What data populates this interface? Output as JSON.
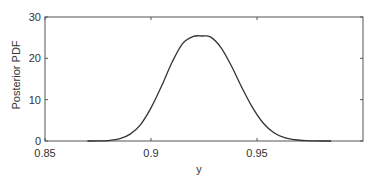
{
  "chart_data": {
    "type": "line",
    "title": "",
    "xlabel": "y",
    "ylabel": "Posterior PDF",
    "xlim": [
      0.85,
      1.0
    ],
    "ylim": [
      0,
      30
    ],
    "grid": false,
    "legend": null,
    "xticks": [
      0.85,
      0.9,
      0.95
    ],
    "xtick_labels": [
      "0.85",
      "0.9",
      "0.95"
    ],
    "yticks": [
      0,
      10,
      20,
      30
    ],
    "ytick_labels": [
      "0",
      "10",
      "20",
      "30"
    ],
    "series": [
      {
        "name": "Posterior PDF",
        "color": "#333333",
        "x": [
          0.87,
          0.875,
          0.88,
          0.885,
          0.89,
          0.895,
          0.9,
          0.905,
          0.91,
          0.915,
          0.92,
          0.924,
          0.928,
          0.933,
          0.938,
          0.943,
          0.948,
          0.953,
          0.958,
          0.963,
          0.968,
          0.973,
          0.978,
          0.985
        ],
        "values": [
          0.0,
          0.02,
          0.11,
          0.5,
          1.6,
          3.9,
          8.0,
          13.3,
          19.1,
          23.6,
          25.3,
          25.4,
          25.2,
          22.6,
          18.1,
          12.8,
          8.0,
          4.3,
          2.0,
          0.8,
          0.3,
          0.07,
          0.01,
          0.0
        ]
      }
    ]
  }
}
